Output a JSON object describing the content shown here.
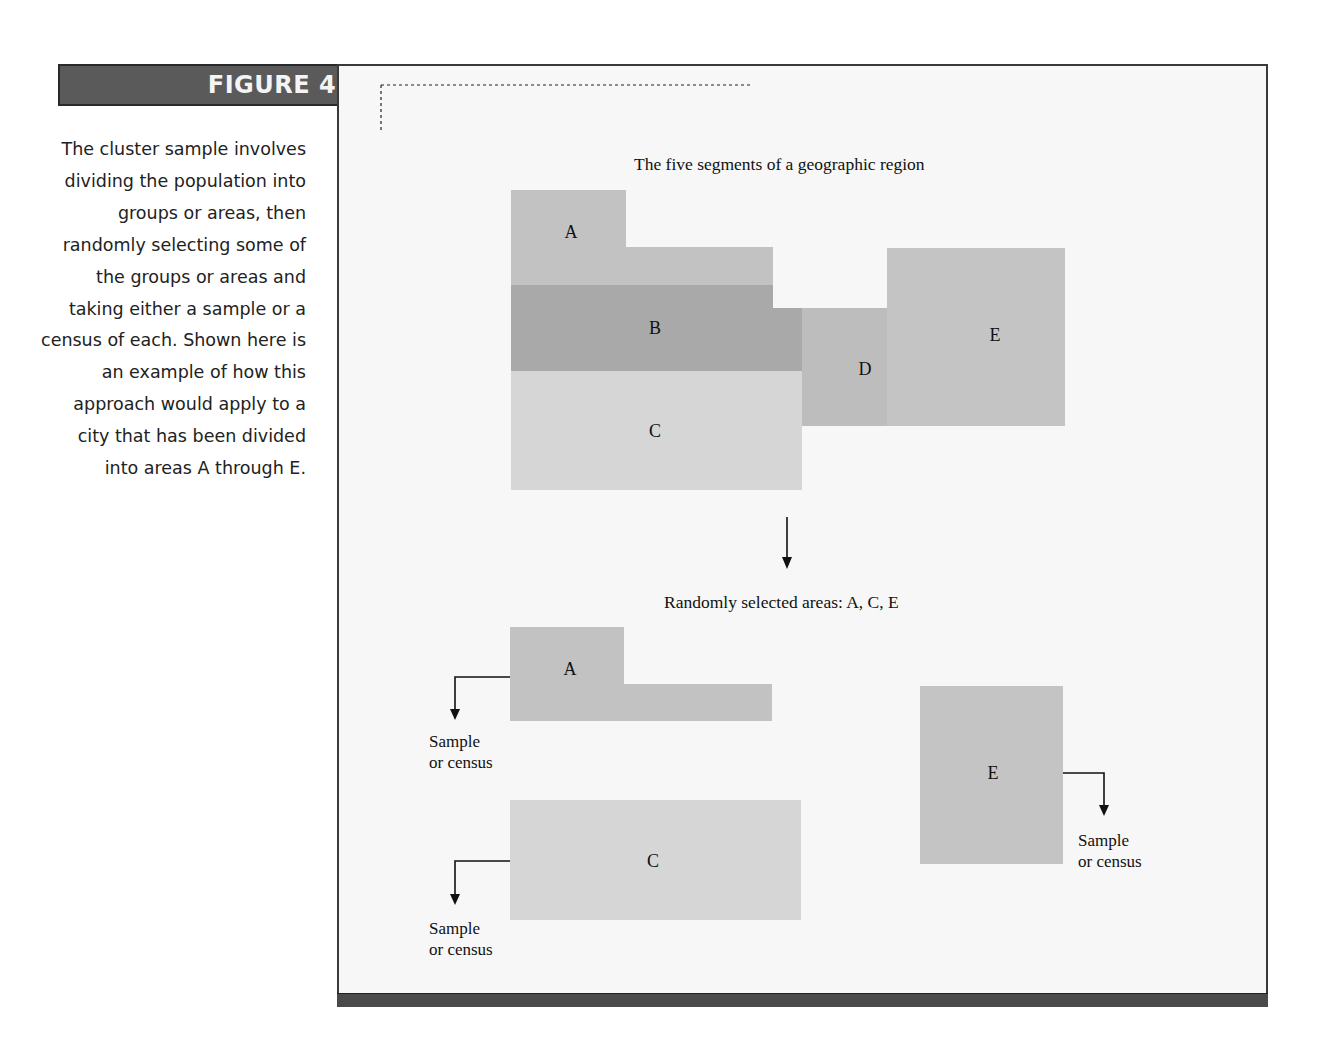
{
  "figure": {
    "label": "FIGURE 4.4",
    "caption": "The cluster sample involves dividing the population into groups or areas, then randomly selecting some of the groups or areas and taking either a sample or a census of each. Shown here is an example of how this approach would apply to a city that has been divided into areas A through E."
  },
  "diagram": {
    "top_title": "The five segments of a geographic region",
    "selection_title": "Randomly selected areas: A, C, E",
    "regions": [
      {
        "id": "A",
        "label": "A",
        "color": "#c2c2c2",
        "selected": true
      },
      {
        "id": "B",
        "label": "B",
        "color": "#a9a9a9",
        "selected": false
      },
      {
        "id": "C",
        "label": "C",
        "color": "#d6d6d6",
        "selected": true
      },
      {
        "id": "D",
        "label": "D",
        "color": "#bdbdbd",
        "selected": false
      },
      {
        "id": "E",
        "label": "E",
        "color": "#c4c4c4",
        "selected": true
      }
    ],
    "selected_areas": [
      {
        "label": "A",
        "note_line1": "Sample",
        "note_line2": "or census"
      },
      {
        "label": "C",
        "note_line1": "Sample",
        "note_line2": "or census"
      },
      {
        "label": "E",
        "note_line1": "Sample",
        "note_line2": "or census"
      }
    ]
  },
  "colors": {
    "header_bg": "#5a5a5a",
    "frame_border": "#3a3a3a",
    "frame_bg": "#f7f7f7",
    "bottom_bar": "#4a4a4a"
  }
}
